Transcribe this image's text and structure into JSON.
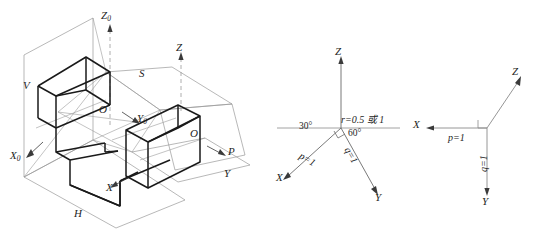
{
  "figure": {
    "title": "",
    "panels": [
      {
        "id": "panel-3d-projection",
        "name": "three-plane-axonometric-construction",
        "labels": {
          "z0": "Z",
          "z0_sub": "0",
          "y0": "Y",
          "y0_sub": "0",
          "x0": "X",
          "x0_sub": "0",
          "origin_upper": "O",
          "origin_right": "O",
          "plane_v": "V",
          "plane_h": "H",
          "plane_s": "S",
          "plane_p": "P",
          "axis_z": "Z",
          "axis_y": "Y",
          "axis_x": "X"
        }
      },
      {
        "id": "panel-isometric-axes",
        "name": "isometric-axis-angles",
        "labels": {
          "axis_z": "Z",
          "axis_x": "X",
          "axis_y": "Y",
          "angle_left": "30°",
          "angle_right": "60°",
          "ratio_r": "r=0.5 或 1",
          "ratio_p": "p=1",
          "ratio_q": "q=1"
        }
      },
      {
        "id": "panel-oblique-axes",
        "name": "oblique-axis-ratios",
        "labels": {
          "axis_z": "Z",
          "axis_x": "X",
          "axis_y": "Y",
          "ratio_p": "p=1",
          "ratio_q": "q=1"
        }
      }
    ]
  },
  "colors": {
    "ink": "#242424",
    "heavy_line": "#1a1a1a",
    "light_line": "#9a9a9a",
    "background": "#ffffff"
  }
}
